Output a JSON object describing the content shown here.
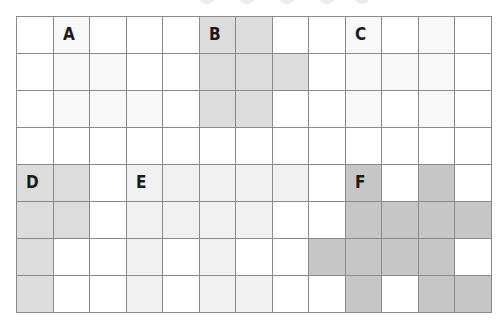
{
  "grid": {
    "cols": 13,
    "rows": 8,
    "colors": {
      "white": "#ffffff",
      "faint": "#f8f8f8",
      "light": "#f1f1f1",
      "gray": "#dcdcdc",
      "dark": "#c6c6c6"
    },
    "regions": [
      {
        "label": "A",
        "shade": "faint",
        "label_cell": [
          1,
          0
        ],
        "cells": [
          [
            1,
            0
          ],
          [
            1,
            1
          ],
          [
            1,
            2
          ],
          [
            2,
            1
          ],
          [
            2,
            2
          ],
          [
            3,
            2
          ]
        ]
      },
      {
        "label": "B",
        "shade": "gray",
        "label_cell": [
          5,
          0
        ],
        "cells": [
          [
            5,
            0
          ],
          [
            5,
            1
          ],
          [
            5,
            2
          ],
          [
            6,
            0
          ],
          [
            6,
            1
          ],
          [
            6,
            2
          ],
          [
            7,
            1
          ]
        ]
      },
      {
        "label": "C",
        "shade": "faint",
        "label_cell": [
          9,
          0
        ],
        "cells": [
          [
            9,
            0
          ],
          [
            9,
            1
          ],
          [
            9,
            2
          ],
          [
            10,
            1
          ],
          [
            11,
            0
          ],
          [
            11,
            1
          ],
          [
            11,
            2
          ]
        ]
      },
      {
        "label": "D",
        "shade": "gray",
        "label_cell": [
          0,
          4
        ],
        "cells": [
          [
            0,
            4
          ],
          [
            0,
            5
          ],
          [
            0,
            6
          ],
          [
            0,
            7
          ],
          [
            1,
            4
          ],
          [
            1,
            5
          ]
        ]
      },
      {
        "label": "E",
        "shade": "light",
        "label_cell": [
          3,
          4
        ],
        "cells": [
          [
            3,
            4
          ],
          [
            3,
            5
          ],
          [
            3,
            6
          ],
          [
            3,
            7
          ],
          [
            4,
            4
          ],
          [
            4,
            5
          ],
          [
            5,
            4
          ],
          [
            5,
            5
          ],
          [
            5,
            6
          ],
          [
            5,
            7
          ],
          [
            6,
            4
          ],
          [
            6,
            5
          ],
          [
            6,
            7
          ],
          [
            7,
            4
          ]
        ]
      },
      {
        "label": "F",
        "shade": "dark",
        "label_cell": [
          9,
          4
        ],
        "cells": [
          [
            9,
            4
          ],
          [
            9,
            5
          ],
          [
            9,
            6
          ],
          [
            9,
            7
          ],
          [
            10,
            5
          ],
          [
            10,
            6
          ],
          [
            11,
            4
          ],
          [
            11,
            5
          ],
          [
            11,
            6
          ],
          [
            11,
            7
          ],
          [
            12,
            5
          ],
          [
            12,
            7
          ],
          [
            8,
            6
          ]
        ]
      }
    ]
  }
}
